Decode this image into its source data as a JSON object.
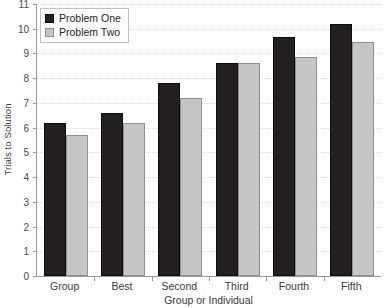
{
  "chart_data": {
    "type": "bar",
    "title": "",
    "subtitle": "",
    "xlabel": "Group or Individual",
    "ylabel": "Trials to Solution",
    "categories": [
      "Group",
      "Best",
      "Second",
      "Third",
      "Fourth",
      "Fifth"
    ],
    "series": [
      {
        "name": "Problem One",
        "color": "#231f20",
        "values": [
          6.2,
          6.6,
          7.8,
          8.6,
          9.65,
          10.2
        ]
      },
      {
        "name": "Problem Two",
        "color": "#c6c6c6",
        "values": [
          5.7,
          6.2,
          7.2,
          8.6,
          8.85,
          9.45
        ]
      }
    ],
    "ylim": [
      0,
      11
    ],
    "ytick_labels": [
      "0",
      "1",
      "2",
      "3",
      "4",
      "5",
      "6",
      "7",
      "8",
      "9",
      "10",
      "11"
    ],
    "ytick_values": [
      0,
      1,
      2,
      3,
      4,
      5,
      6,
      7,
      8,
      9,
      10,
      11
    ],
    "grid": true,
    "grid_axis": "y",
    "grid_style": "dotted",
    "legend_position": "upper left",
    "legend_inside_plot": true,
    "annotations": []
  },
  "colors": {
    "series_one": "#231f20",
    "series_two": "#c6c6c6",
    "axis": "#9a9a9a",
    "gridline": "#dedede",
    "text": "#231f20",
    "background": "#ffffff"
  }
}
